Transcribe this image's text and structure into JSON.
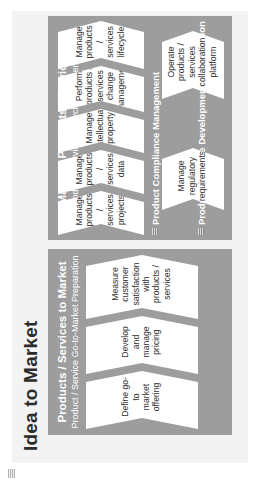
{
  "page": {
    "title": "Idea to Market",
    "corner_mark": "page-corner-marker"
  },
  "groups": [
    {
      "id": "products-services-to-market",
      "title": "Products / Services to Market",
      "subtitle": "Product / Service Go-to-Market Preparation",
      "steps": [
        {
          "lines": [
            "Define go-to",
            "market offering"
          ]
        },
        {
          "lines": [
            "Develop and",
            "manage pricing"
          ]
        },
        {
          "lines": [
            "Measure customer",
            "satisfaction with",
            "products / services"
          ]
        }
      ]
    },
    {
      "id": "manage-products-services",
      "title": "Manage Products / Services",
      "subtitle": "Product / Service Lifecycle Management",
      "steps": [
        {
          "lines": [
            "Manage",
            "products / services",
            "projects"
          ]
        },
        {
          "lines": [
            "Manage products /",
            "services data"
          ]
        },
        {
          "lines": [
            "Manage",
            "intellectual",
            "property"
          ]
        },
        {
          "lines": [
            "Perform products /",
            "services change",
            "management"
          ]
        },
        {
          "lines": [
            "Manage products /",
            "services lifecycle"
          ]
        }
      ],
      "bands": [
        {
          "id": "product-compliance-management",
          "label": "Product Compliance Management",
          "steps": [
            {
              "lines": [
                "Manage regulatory",
                "requirements"
              ]
            }
          ]
        },
        {
          "id": "product-service-development-collaboration",
          "label": "Product / Service Development Collaboration",
          "steps": [
            {
              "lines": [
                "Operate products /",
                "services",
                "collaboration",
                "platform"
              ]
            }
          ]
        }
      ]
    }
  ],
  "colors": {
    "panel": "#9d9d9d",
    "card": "#ffffff",
    "page_background": "#ffffff",
    "plate": "#f3f3f3",
    "title_text": "#2b2b2b",
    "panel_text": "#ffffff",
    "card_text": "#303030"
  }
}
